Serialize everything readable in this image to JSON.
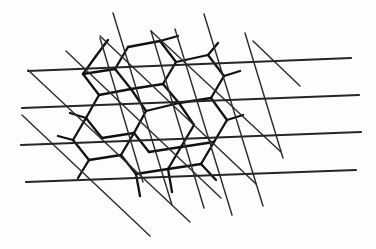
{
  "figure": {
    "width": 376,
    "height": 249,
    "background_color": "#fdfdfd",
    "stroke_color": "#2b2b2b",
    "tile_stroke_color": "#111111"
  },
  "legend": {
    "families": [
      {
        "name": "horizontal",
        "label": "Horizontal family",
        "count": 4,
        "color": "#262626",
        "stroke_width": 2.1
      },
      {
        "name": "steep",
        "label": "Steep descending family",
        "count": 6,
        "color": "#2e2e2e",
        "stroke_width": 1.45
      },
      {
        "name": "shallow",
        "label": "Shallow descending family",
        "count": 6,
        "color": "#2e2e2e",
        "stroke_width": 1.45
      }
    ]
  },
  "chart_data": {
    "type": "line",
    "xlabel": "",
    "ylabel": "",
    "xlim": [
      0,
      376
    ],
    "ylim": [
      0,
      249
    ],
    "grid": false,
    "legend_position": "none",
    "series": [
      {
        "name": "horizontal",
        "color": "#262626",
        "width": 2.1,
        "segments": [
          [
            28,
            71,
            351,
            58
          ],
          [
            22,
            108,
            359,
            95
          ],
          [
            21,
            145,
            361,
            132
          ],
          [
            26,
            182,
            356,
            170
          ]
        ]
      },
      {
        "name": "steep",
        "color": "#2e2e2e",
        "width": 1.45,
        "segments": [
          [
            113,
            13,
            172,
            205
          ],
          [
            151,
            31,
            204,
            208
          ],
          [
            100,
            38,
            143,
            182
          ],
          [
            175,
            29,
            232,
            215
          ],
          [
            204,
            14,
            263,
            206
          ],
          [
            245,
            33,
            283,
            158
          ]
        ]
      },
      {
        "name": "shallow",
        "color": "#2e2e2e",
        "width": 1.45,
        "segments": [
          [
            28,
            70,
            190,
            222
          ],
          [
            22,
            115,
            150,
            236
          ],
          [
            100,
            36,
            256,
            184
          ],
          [
            66,
            51,
            221,
            198
          ],
          [
            151,
            31,
            281,
            152
          ],
          [
            253,
            41,
            300,
            86
          ]
        ]
      },
      {
        "name": "hex-tiling",
        "color": "#111111",
        "width": 2.3,
        "segments": [
          [
            128,
            47,
            160,
            41
          ],
          [
            160,
            41,
            176,
            62
          ],
          [
            176,
            62,
            163,
            84
          ],
          [
            163,
            84,
            131,
            89
          ],
          [
            131,
            89,
            115,
            69
          ],
          [
            115,
            69,
            128,
            47
          ],
          [
            176,
            62,
            208,
            55
          ],
          [
            208,
            55,
            224,
            76
          ],
          [
            224,
            76,
            211,
            98
          ],
          [
            211,
            98,
            179,
            103
          ],
          [
            179,
            103,
            163,
            84
          ],
          [
            160,
            41,
            178,
            36
          ],
          [
            208,
            55,
            218,
            43
          ],
          [
            131,
            89,
            146,
            111
          ],
          [
            146,
            111,
            134,
            133
          ],
          [
            134,
            133,
            102,
            138
          ],
          [
            102,
            138,
            86,
            118
          ],
          [
            86,
            118,
            99,
            95
          ],
          [
            99,
            95,
            131,
            89
          ],
          [
            179,
            103,
            194,
            125
          ],
          [
            194,
            125,
            181,
            147
          ],
          [
            181,
            147,
            149,
            152
          ],
          [
            149,
            152,
            134,
            133
          ],
          [
            146,
            111,
            179,
            103
          ],
          [
            211,
            98,
            227,
            120
          ],
          [
            227,
            120,
            214,
            142
          ],
          [
            214,
            142,
            181,
            147
          ],
          [
            224,
            76,
            240,
            71
          ],
          [
            134,
            133,
            121,
            155
          ],
          [
            121,
            155,
            89,
            160
          ],
          [
            89,
            160,
            73,
            140
          ],
          [
            73,
            140,
            86,
            118
          ],
          [
            181,
            147,
            168,
            169
          ],
          [
            168,
            169,
            136,
            174
          ],
          [
            136,
            174,
            121,
            155
          ],
          [
            214,
            142,
            201,
            164
          ],
          [
            201,
            164,
            168,
            169
          ],
          [
            99,
            95,
            83,
            74
          ],
          [
            83,
            74,
            96,
            56
          ],
          [
            115,
            69,
            83,
            74
          ],
          [
            136,
            174,
            140,
            196
          ],
          [
            168,
            169,
            172,
            192
          ],
          [
            89,
            160,
            78,
            178
          ],
          [
            227,
            120,
            243,
            115
          ],
          [
            73,
            140,
            58,
            136
          ],
          [
            86,
            118,
            70,
            113
          ],
          [
            201,
            164,
            216,
            180
          ],
          [
            96,
            56,
            108,
            40
          ]
        ]
      }
    ]
  }
}
